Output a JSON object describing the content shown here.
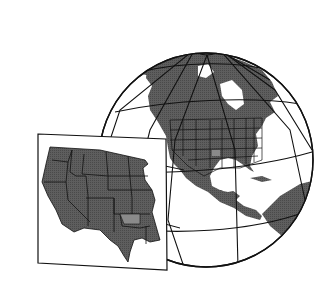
{
  "illustration": {
    "caption": "Globe centered on North America with an inset map of the western United States",
    "colors": {
      "background": "#ffffff",
      "land": "#5a5a5a",
      "highlight_state": "#8a8a8a",
      "line": "#111111",
      "inset_paper": "#ffffff"
    },
    "elements": [
      "globe",
      "graticule",
      "north-america",
      "inset-map",
      "western-us-states",
      "highlighted-state"
    ]
  }
}
